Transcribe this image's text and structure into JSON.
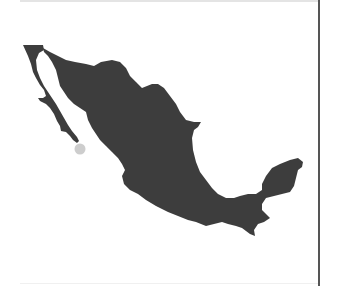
{
  "map": {
    "region": "Mexico",
    "fill_color": "#3d3d3d",
    "background_color": "#ffffff",
    "marker": {
      "label": "",
      "color": "#c8c8c8",
      "location_hint": "Southern tip of Baja California",
      "x": 80,
      "y": 149,
      "radius": 5.5
    }
  },
  "layout": {
    "divider_color": "#555555",
    "top_border_color": "#e4e4e4"
  }
}
